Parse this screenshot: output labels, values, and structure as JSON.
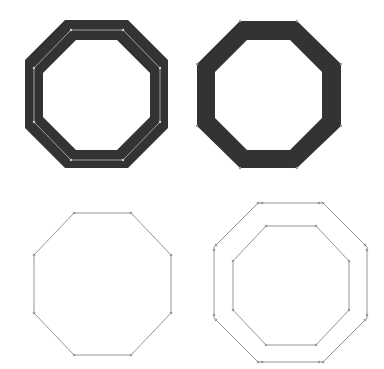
{
  "colors": {
    "fill": "#333333",
    "background": "#ffffff",
    "thin_stroke": "#8a8a8a",
    "inner_path": "#bdbdbd",
    "anchor": "#9a9a9a"
  },
  "panels": [
    {
      "id": "thick-stroke-with-path",
      "description": "Thick octagon ring with centerline path and anchors"
    },
    {
      "id": "expanded-stroke",
      "description": "Octagon ring expanded into filled shape"
    },
    {
      "id": "single-path",
      "description": "Single thin octagon path"
    },
    {
      "id": "outlined-paths",
      "description": "Two concentric octagon outlines"
    }
  ]
}
